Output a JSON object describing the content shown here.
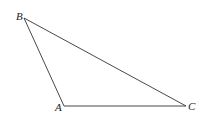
{
  "diagram": {
    "type": "triangle",
    "vertices": [
      {
        "label": "A",
        "x": 64,
        "y": 106
      },
      {
        "label": "B",
        "x": 24,
        "y": 18
      },
      {
        "label": "C",
        "x": 186,
        "y": 106
      }
    ],
    "edges": [
      [
        "A",
        "B"
      ],
      [
        "B",
        "C"
      ],
      [
        "A",
        "C"
      ]
    ],
    "stroke_color": "#333333"
  }
}
